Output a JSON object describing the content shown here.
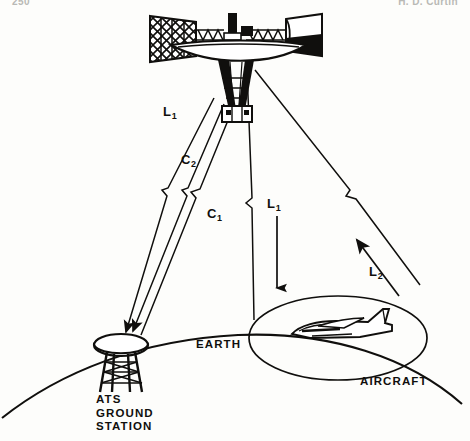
{
  "page": {
    "header_left": "250",
    "header_right": "H. D. Curtin",
    "width": 470,
    "height": 441,
    "background": "#fdfdfb",
    "ink": "#100f0d"
  },
  "figure": {
    "labels": {
      "earth": "EARTH",
      "aircraft": "AIRCRAFT",
      "ground_station_lines": [
        "ATS",
        "GROUND",
        "STATION"
      ]
    },
    "link_labels": [
      {
        "id": "l1-uplink",
        "base": "L",
        "sub": "1",
        "text": "L1",
        "x": 163,
        "y": 112,
        "direction": "down",
        "endpoint": "ats-ground-station"
      },
      {
        "id": "c2-downlink",
        "base": "C",
        "sub": "2",
        "text": "C2",
        "x": 181,
        "y": 160,
        "direction": "down",
        "endpoint": "ats-ground-station"
      },
      {
        "id": "c1-uplink",
        "base": "C",
        "sub": "1",
        "text": "C1",
        "x": 207,
        "y": 214,
        "direction": "up",
        "endpoint": "satellite"
      },
      {
        "id": "l1-beam",
        "base": "L",
        "sub": "1",
        "text": "L1",
        "x": 267,
        "y": 203,
        "direction": "down",
        "endpoint": "earth-footprint"
      },
      {
        "id": "l2-aircraft",
        "base": "L",
        "sub": "2",
        "text": "L2",
        "x": 369,
        "y": 272,
        "direction": "up",
        "endpoint": "satellite"
      }
    ],
    "elements": [
      {
        "name": "satellite",
        "kind": "spacecraft",
        "detail": "solar-panel array, dish antenna, cylindrical module, conical horn antennas"
      },
      {
        "name": "ats-ground-station",
        "kind": "dish-on-tower"
      },
      {
        "name": "aircraft",
        "kind": "jet-aircraft"
      },
      {
        "name": "earth-horizon",
        "kind": "arc"
      },
      {
        "name": "coverage-footprint",
        "kind": "ellipse"
      },
      {
        "name": "beam-cone",
        "kind": "cone"
      }
    ]
  }
}
